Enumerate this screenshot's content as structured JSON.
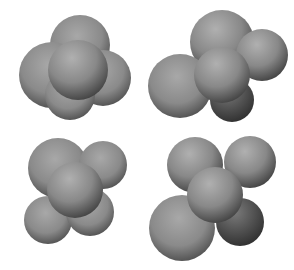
{
  "image": {
    "description": "Four gray 3D molecular surface renderings arranged in a 2x2 grid on white background",
    "background": "#ffffff",
    "surface_color": "#8a8a8a",
    "shapes": [
      {
        "position": "top-left",
        "label": ""
      },
      {
        "position": "top-right",
        "label": ""
      },
      {
        "position": "bottom-left",
        "label": ""
      },
      {
        "position": "bottom-right",
        "label": ""
      }
    ]
  }
}
